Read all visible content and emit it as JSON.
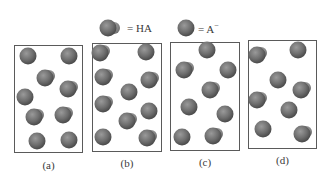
{
  "legend": {
    "ha": {
      "symbol": "ha-molecule-icon",
      "label": "= HA"
    },
    "a_minus": {
      "symbol": "a-minus-ion-icon",
      "label": "= A",
      "superscript": "−"
    }
  },
  "colors": {
    "sphere_main": "#6e6e6e",
    "sphere_dark": "#4a4a4a",
    "sphere_light": "#9a9a9a",
    "h_atom": "#8c8c8c",
    "frame": "#5a5a5a"
  },
  "panels": [
    {
      "label": "(a)",
      "box": {
        "x": 14,
        "y": 45,
        "w": 69,
        "h": 108
      },
      "label_pos": {
        "x": 28,
        "y": 159
      },
      "molecules": [
        {
          "type": "A-",
          "x": 28,
          "y": 56
        },
        {
          "type": "A-",
          "x": 69,
          "y": 56
        },
        {
          "type": "HA",
          "x": 45,
          "y": 78
        },
        {
          "type": "HA",
          "x": 68,
          "y": 89
        },
        {
          "type": "A-",
          "x": 25,
          "y": 97
        },
        {
          "type": "HA",
          "x": 34,
          "y": 117
        },
        {
          "type": "HA",
          "x": 63,
          "y": 115
        },
        {
          "type": "A-",
          "x": 37,
          "y": 141
        },
        {
          "type": "A-",
          "x": 69,
          "y": 140
        }
      ]
    },
    {
      "label": "(b)",
      "box": {
        "x": 92,
        "y": 43,
        "w": 70,
        "h": 109
      },
      "label_pos": {
        "x": 106,
        "y": 157
      },
      "molecules": [
        {
          "type": "HA",
          "x": 100,
          "y": 53
        },
        {
          "type": "A-",
          "x": 146,
          "y": 52
        },
        {
          "type": "HA",
          "x": 103,
          "y": 77
        },
        {
          "type": "HA",
          "x": 149,
          "y": 80
        },
        {
          "type": "A-",
          "x": 129,
          "y": 92
        },
        {
          "type": "HA",
          "x": 103,
          "y": 104
        },
        {
          "type": "A-",
          "x": 149,
          "y": 111
        },
        {
          "type": "HA",
          "x": 127,
          "y": 121
        },
        {
          "type": "A-",
          "x": 103,
          "y": 137
        },
        {
          "type": "HA",
          "x": 147,
          "y": 138
        }
      ]
    },
    {
      "label": "(c)",
      "box": {
        "x": 170,
        "y": 42,
        "w": 70,
        "h": 109
      },
      "label_pos": {
        "x": 184,
        "y": 156
      },
      "molecules": [
        {
          "type": "A-",
          "x": 207,
          "y": 50
        },
        {
          "type": "HA",
          "x": 184,
          "y": 70
        },
        {
          "type": "A-",
          "x": 228,
          "y": 70
        },
        {
          "type": "HA",
          "x": 210,
          "y": 90
        },
        {
          "type": "A-",
          "x": 189,
          "y": 107
        },
        {
          "type": "A-",
          "x": 225,
          "y": 114
        },
        {
          "type": "A-",
          "x": 182,
          "y": 137
        },
        {
          "type": "HA",
          "x": 213,
          "y": 136
        }
      ]
    },
    {
      "label": "(d)",
      "box": {
        "x": 248,
        "y": 40,
        "w": 69,
        "h": 109
      },
      "label_pos": {
        "x": 262,
        "y": 154
      },
      "molecules": [
        {
          "type": "HA",
          "x": 257,
          "y": 55
        },
        {
          "type": "A-",
          "x": 298,
          "y": 50
        },
        {
          "type": "A-",
          "x": 278,
          "y": 80
        },
        {
          "type": "HA",
          "x": 301,
          "y": 90
        },
        {
          "type": "HA",
          "x": 257,
          "y": 100
        },
        {
          "type": "A-",
          "x": 289,
          "y": 110
        },
        {
          "type": "A-",
          "x": 263,
          "y": 129
        },
        {
          "type": "HA",
          "x": 302,
          "y": 134
        }
      ]
    }
  ]
}
